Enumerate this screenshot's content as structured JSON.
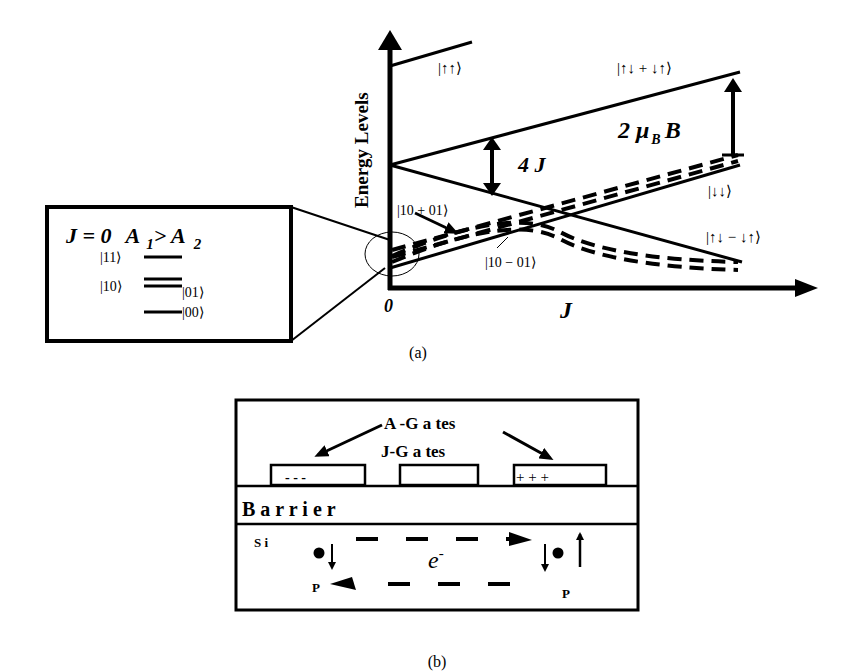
{
  "panel_a": {
    "caption": "(a)",
    "y_axis_label": "Energy Levels",
    "x_axis_label": "J",
    "origin_label": "0",
    "states": {
      "up_up": "|↑↑⟩",
      "triplet0": "|↑↓ + ↓↑⟩",
      "down_down": "|↓↓⟩",
      "singlet": "|↑↓ − ↓↑⟩",
      "plus": "|10 + 01⟩",
      "minus": "|10 − 01⟩"
    },
    "gap_4j": "4 J",
    "gap_zeeman": "2 μ",
    "gap_zeeman_sub": "B",
    "gap_zeeman_tail": "B",
    "inset": {
      "title_j": "J = 0",
      "title_a": "A",
      "sub1": "1",
      "gt": "> A",
      "sub2": "2",
      "levels": [
        "|11⟩",
        "|10⟩",
        "|01⟩",
        "|00⟩"
      ]
    }
  },
  "panel_b": {
    "caption": "(b)",
    "a_gates": "A -G a tes",
    "j_gates": "J-G a tes",
    "left_gate_charge": "-  -  -",
    "right_gate_charge": "+   +   +",
    "barrier": "B a r r i e r",
    "si": "S i",
    "electron": "e",
    "electron_sup": "-",
    "donor_left": "P",
    "donor_right": "P"
  }
}
